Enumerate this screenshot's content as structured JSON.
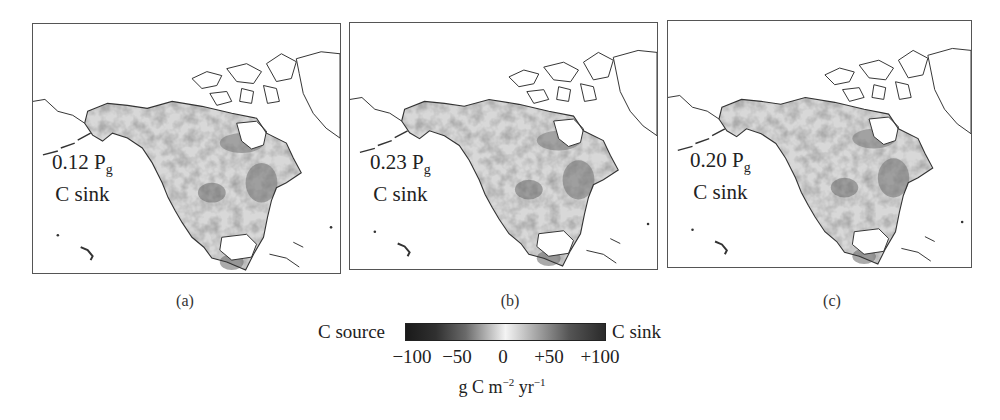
{
  "figure": {
    "panels": [
      {
        "id": "a",
        "label": "(a)",
        "value": "0.12 P",
        "value_sub": "g",
        "text": "C sink",
        "bias": 0.45
      },
      {
        "id": "b",
        "label": "(b)",
        "value": "0.23 P",
        "value_sub": "g",
        "text": "C sink",
        "bias": 0.6
      },
      {
        "id": "c",
        "label": "(c)",
        "value": "0.20 P",
        "value_sub": "g",
        "text": "C sink",
        "bias": 0.55
      }
    ],
    "colorbar": {
      "left_label": "C source",
      "right_label": "C sink",
      "ticks": [
        "−100",
        "−50",
        "0",
        "+50",
        "+100"
      ],
      "tick_values": [
        -100,
        -50,
        0,
        50,
        100
      ],
      "unit_base": "g C m",
      "unit_exp1": "−2",
      "unit_mid": " yr",
      "unit_exp2": "−1",
      "colors": {
        "min": "#1a1a1a",
        "mid": "#f4f4f4",
        "max": "#2a2a2a"
      }
    },
    "map_region": "North America",
    "colors": {
      "outline": "#333333",
      "frame": "#555555",
      "background": "#ffffff"
    }
  }
}
